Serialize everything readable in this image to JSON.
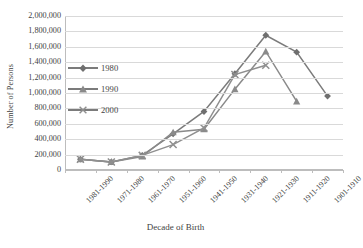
{
  "chart_data": {
    "type": "line",
    "title": "",
    "xlabel": "Decade of Birth",
    "ylabel": "Number of Persons",
    "categories": [
      "1981-1990",
      "1971-1980",
      "1961-1970",
      "1951-1960",
      "1941-1950",
      "1931-1940",
      "1921-1930",
      "1911-1920",
      "1901-1910"
    ],
    "ylim": [
      0,
      2000000
    ],
    "ytick_labels": [
      "0",
      "200,000",
      "400,000",
      "600,000",
      "800,000",
      "1,000,000",
      "1,200,000",
      "1,400,000",
      "1,600,000",
      "1,800,000",
      "2,000,000"
    ],
    "ytick_values": [
      0,
      200000,
      400000,
      600000,
      800000,
      1000000,
      1200000,
      1400000,
      1600000,
      1800000,
      2000000
    ],
    "grid": true,
    "legend_position": "inside-left",
    "series": [
      {
        "name": "1980",
        "marker": "diamond",
        "color": "#7b7b7b",
        "values": [
          140000,
          105000,
          190000,
          470000,
          760000,
          1250000,
          1750000,
          1530000,
          960000
        ]
      },
      {
        "name": "1990",
        "marker": "triangle",
        "color": "#8a8a8a",
        "values": [
          140000,
          105000,
          175000,
          490000,
          530000,
          1050000,
          1540000,
          890000,
          null
        ]
      },
      {
        "name": "2000",
        "marker": "x",
        "color": "#8f8f8f",
        "values": [
          140000,
          105000,
          190000,
          330000,
          545000,
          1240000,
          1360000,
          null,
          null
        ]
      }
    ]
  },
  "axis": {
    "y_title": "Number of Persons",
    "x_title": "Decade of Birth"
  },
  "legend": {
    "items": [
      {
        "label": "1980"
      },
      {
        "label": "1990"
      },
      {
        "label": "2000"
      }
    ]
  }
}
